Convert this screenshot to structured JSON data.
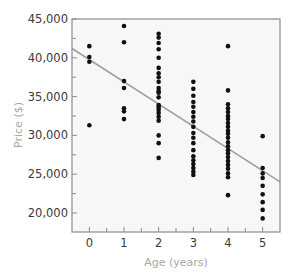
{
  "chart_data": {
    "type": "scatter",
    "title": "",
    "xlabel": "Age (years)",
    "ylabel": "Price ($)",
    "xlim": [
      -0.5,
      5.5
    ],
    "ylim": [
      17550,
      45000
    ],
    "xticks": [
      0,
      1,
      2,
      3,
      4,
      5
    ],
    "xtick_labels": [
      "0",
      "1",
      "2",
      "3",
      "4",
      "5"
    ],
    "yticks": [
      20000,
      25000,
      30000,
      35000,
      40000,
      45000
    ],
    "ytick_labels": [
      "20,000",
      "25,000",
      "30,000",
      "35,000",
      "40,000",
      "45,000"
    ],
    "grid": false,
    "legend": null,
    "series": [
      {
        "name": "Cars",
        "type": "scatter",
        "color": "#111111",
        "points": [
          {
            "x": 0,
            "y": 41500
          },
          {
            "x": 0,
            "y": 40100
          },
          {
            "x": 0,
            "y": 39500
          },
          {
            "x": 0,
            "y": 31300
          },
          {
            "x": 1,
            "y": 44100
          },
          {
            "x": 1,
            "y": 42000
          },
          {
            "x": 1,
            "y": 37000
          },
          {
            "x": 1,
            "y": 36100
          },
          {
            "x": 1,
            "y": 33500
          },
          {
            "x": 1,
            "y": 33100
          },
          {
            "x": 1,
            "y": 32100
          },
          {
            "x": 2,
            "y": 43100
          },
          {
            "x": 2,
            "y": 42600
          },
          {
            "x": 2,
            "y": 41900
          },
          {
            "x": 2,
            "y": 41100
          },
          {
            "x": 2,
            "y": 40000
          },
          {
            "x": 2,
            "y": 38700
          },
          {
            "x": 2,
            "y": 38000
          },
          {
            "x": 2,
            "y": 37500
          },
          {
            "x": 2,
            "y": 36900
          },
          {
            "x": 2,
            "y": 36100
          },
          {
            "x": 2,
            "y": 35700
          },
          {
            "x": 2,
            "y": 35500
          },
          {
            "x": 2,
            "y": 34900
          },
          {
            "x": 2,
            "y": 33900
          },
          {
            "x": 2,
            "y": 33600
          },
          {
            "x": 2,
            "y": 33300
          },
          {
            "x": 2,
            "y": 32900
          },
          {
            "x": 2,
            "y": 32400
          },
          {
            "x": 2,
            "y": 31900
          },
          {
            "x": 2,
            "y": 30000
          },
          {
            "x": 2,
            "y": 29000
          },
          {
            "x": 2,
            "y": 27100
          },
          {
            "x": 3,
            "y": 36900
          },
          {
            "x": 3,
            "y": 36000
          },
          {
            "x": 3,
            "y": 35100
          },
          {
            "x": 3,
            "y": 34300
          },
          {
            "x": 3,
            "y": 33700
          },
          {
            "x": 3,
            "y": 33000
          },
          {
            "x": 3,
            "y": 32400
          },
          {
            "x": 3,
            "y": 31800
          },
          {
            "x": 3,
            "y": 31100
          },
          {
            "x": 3,
            "y": 30300
          },
          {
            "x": 3,
            "y": 29700
          },
          {
            "x": 3,
            "y": 29000
          },
          {
            "x": 3,
            "y": 28100
          },
          {
            "x": 3,
            "y": 27300
          },
          {
            "x": 3,
            "y": 26800
          },
          {
            "x": 3,
            "y": 26300
          },
          {
            "x": 3,
            "y": 25800
          },
          {
            "x": 3,
            "y": 25300
          },
          {
            "x": 3,
            "y": 24900
          },
          {
            "x": 4,
            "y": 41500
          },
          {
            "x": 4,
            "y": 35800
          },
          {
            "x": 4,
            "y": 34000
          },
          {
            "x": 4,
            "y": 33500
          },
          {
            "x": 4,
            "y": 33000
          },
          {
            "x": 4,
            "y": 32500
          },
          {
            "x": 4,
            "y": 32100
          },
          {
            "x": 4,
            "y": 31600
          },
          {
            "x": 4,
            "y": 31100
          },
          {
            "x": 4,
            "y": 30600
          },
          {
            "x": 4,
            "y": 30200
          },
          {
            "x": 4,
            "y": 29700
          },
          {
            "x": 4,
            "y": 29100
          },
          {
            "x": 4,
            "y": 28600
          },
          {
            "x": 4,
            "y": 28100
          },
          {
            "x": 4,
            "y": 27700
          },
          {
            "x": 4,
            "y": 27200
          },
          {
            "x": 4,
            "y": 26700
          },
          {
            "x": 4,
            "y": 26200
          },
          {
            "x": 4,
            "y": 25700
          },
          {
            "x": 4,
            "y": 25100
          },
          {
            "x": 4,
            "y": 24600
          },
          {
            "x": 4,
            "y": 22300
          },
          {
            "x": 5,
            "y": 29900
          },
          {
            "x": 5,
            "y": 25800
          },
          {
            "x": 5,
            "y": 25100
          },
          {
            "x": 5,
            "y": 24500
          },
          {
            "x": 5,
            "y": 23500
          },
          {
            "x": 5,
            "y": 22400
          },
          {
            "x": 5,
            "y": 21400
          },
          {
            "x": 5,
            "y": 20400
          },
          {
            "x": 5,
            "y": 19300
          }
        ]
      },
      {
        "name": "Regression line",
        "type": "line",
        "color": "#a0a0a0",
        "points": [
          {
            "x": -0.5,
            "y": 41200
          },
          {
            "x": 5.5,
            "y": 24000
          }
        ]
      }
    ]
  },
  "colors": {
    "frame": "#8c8c8c",
    "plot_bg": "#f7f7f7",
    "tick_text": "#3a3a3a",
    "axis_title": "#a8a8a8"
  }
}
